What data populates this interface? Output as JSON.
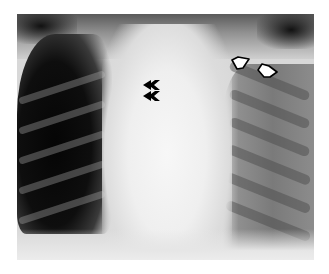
{
  "image": {
    "subject": "Chest radiograph (frontal view)",
    "background_color": "#ffffff",
    "frame": {
      "left": 17,
      "top": 14,
      "width": 297,
      "height": 246
    }
  },
  "annotations": {
    "filled_arrowheads": [
      {
        "label": "arrowhead-upper",
        "shape": "double-chevron-left",
        "color": "#000000",
        "x": 143,
        "y": 80
      },
      {
        "label": "arrowhead-lower",
        "shape": "double-chevron-left",
        "color": "#000000",
        "x": 143,
        "y": 91
      }
    ],
    "open_arrows": [
      {
        "label": "open-arrow-1",
        "shape": "hollow-arrow-down-left",
        "color": "#000000",
        "x": 231,
        "y": 57
      },
      {
        "label": "open-arrow-2",
        "shape": "hollow-arrow-down-left",
        "color": "#000000",
        "x": 257,
        "y": 64
      }
    ]
  }
}
